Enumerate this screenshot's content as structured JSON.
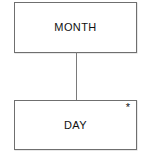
{
  "diagram": {
    "type": "entity-relationship-diagram",
    "background_color": "#ffffff",
    "line_color": "#6f6f6f",
    "text_color": "#111111",
    "entities": [
      {
        "id": "month",
        "label": "MONTH",
        "marker": ""
      },
      {
        "id": "day",
        "label": "DAY",
        "marker": "*"
      }
    ],
    "connector": {
      "from": "month",
      "to": "day",
      "style": "vertical-line"
    },
    "caption": "clipped"
  }
}
